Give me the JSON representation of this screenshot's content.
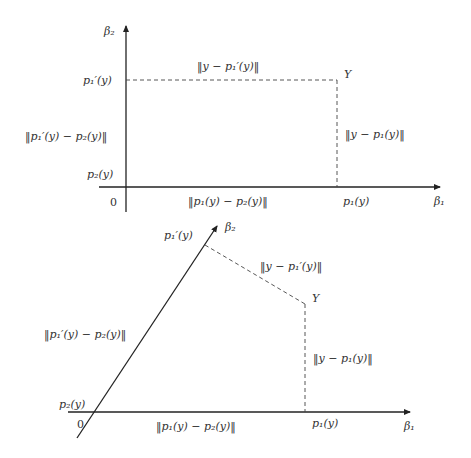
{
  "diagrams": [
    {
      "name": "orthogonal-axes",
      "axes": {
        "x_label": "β₁",
        "y_label": "β₂",
        "origin_label": "0"
      },
      "point_label": "Y",
      "tick_labels": {
        "y_upper": "p₁′(y)",
        "y_lower": "p₂(y)",
        "x_tick": "p₁(y)"
      },
      "distance_labels": {
        "top": "‖y − p₁′(y)‖",
        "right": "‖y − p₁(y)‖",
        "left": "‖p₁′(y) − p₂(y)‖",
        "bottom": "‖p₁(y) − p₂(y)‖"
      }
    },
    {
      "name": "oblique-axes",
      "axes": {
        "x_label": "β₁",
        "y_label": "β₂",
        "origin_label": "0"
      },
      "point_label": "Y",
      "tick_labels": {
        "y_upper": "p₁′(y)",
        "y_lower": "p₂(y)",
        "x_tick": "p₁(y)"
      },
      "distance_labels": {
        "top": "‖y − p₁′(y)‖",
        "right": "‖y − p₁(y)‖",
        "left": "‖p₁′(y) − p₂(y)‖",
        "bottom": "‖p₁(y) − p₂(y)‖"
      }
    }
  ],
  "colors": {
    "axis": "#222222",
    "dashed": "#444444",
    "text": "#333333"
  }
}
